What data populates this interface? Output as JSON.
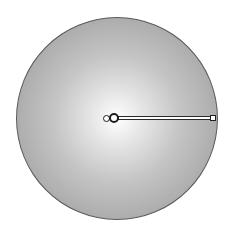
{
  "canvas": {
    "shape": "circle",
    "fill": "radial-gradient",
    "gradient_stops": [
      {
        "color": "#ffffff",
        "position": 0
      },
      {
        "color": "#9a9a9a",
        "position": 100
      }
    ],
    "outline_color": "#5a5a5a"
  },
  "gradient_tool": {
    "center_handle_icon": "circle-handle-icon",
    "focal_handle_icon": "small-circle-handle-icon",
    "end_handle_icon": "square-handle-icon",
    "line_color": "#2a2a2a"
  }
}
